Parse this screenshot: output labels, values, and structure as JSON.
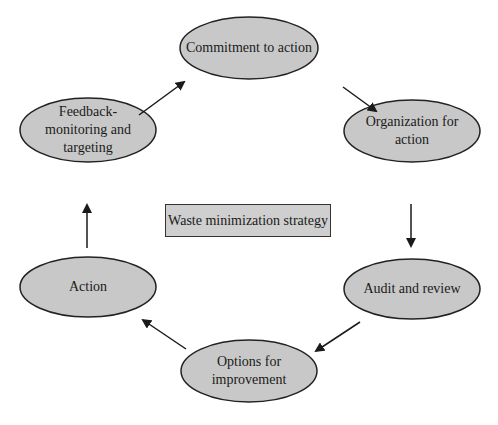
{
  "diagram": {
    "title": "Waste minimization strategy",
    "nodes": [
      {
        "id": "commitment",
        "label": "Commitment to action"
      },
      {
        "id": "organization",
        "label_line1": "Organization for",
        "label_line2": "action"
      },
      {
        "id": "audit",
        "label": "Audit and review"
      },
      {
        "id": "options",
        "label_line1": "Options for",
        "label_line2": "improvement"
      },
      {
        "id": "action",
        "label": "Action"
      },
      {
        "id": "feedback",
        "label_line1": "Feedback-",
        "label_line2": "monitoring and",
        "label_line3": "targeting"
      }
    ],
    "flow": [
      "Commitment to action",
      "Organization for action",
      "Audit and review",
      "Options for improvement",
      "Action",
      "Feedback-monitoring and targeting",
      "Commitment to action"
    ],
    "colors": {
      "ellipse_fill": "#c8c8c8",
      "stroke": "#222222",
      "box_fill": "#cfcfcf"
    }
  }
}
